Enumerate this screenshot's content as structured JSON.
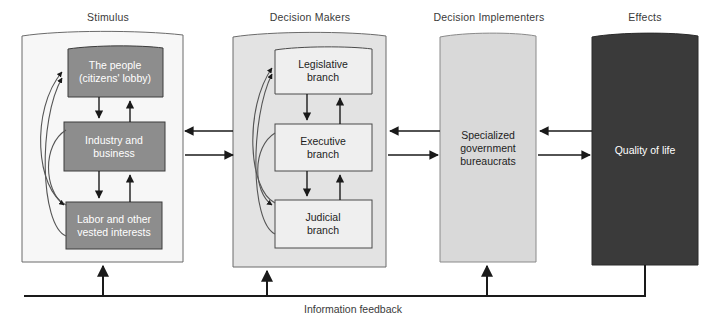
{
  "diagram": {
    "title_visible": false,
    "columns": [
      {
        "key": "stimulus",
        "label": "Stimulus",
        "label_x": 108,
        "label_y": 11
      },
      {
        "key": "decision_makers",
        "label": "Decision Makers",
        "label_x": 310,
        "label_y": 11
      },
      {
        "key": "decision_implementers",
        "label": "Decision Implementers",
        "label_x": 489,
        "label_y": 11
      },
      {
        "key": "effects",
        "label": "Effects",
        "label_x": 645,
        "label_y": 11
      }
    ],
    "panels": [
      {
        "key": "stimulus-panel",
        "x": 22,
        "y": 32,
        "w": 161,
        "h": 230,
        "fill": "#f7f7f7",
        "stroke": "#6b6b6b"
      },
      {
        "key": "decision-makers-panel",
        "x": 233,
        "y": 33,
        "w": 153,
        "h": 234,
        "fill": "#e3e3e3",
        "stroke": "#6b6b6b"
      }
    ],
    "boxes": [
      {
        "key": "the-people",
        "label": "The people\n(citizens' lobby)",
        "x": 68,
        "y": 46,
        "w": 95,
        "h": 51,
        "fill": "#8d8d8d",
        "stroke": "#3d3d3d",
        "text": "light"
      },
      {
        "key": "industry-and-business",
        "label": "Industry and\nbusiness",
        "x": 64,
        "y": 122,
        "w": 101,
        "h": 49,
        "fill": "#8d8d8d",
        "stroke": "#3d3d3d",
        "text": "light"
      },
      {
        "key": "labor-and-other-vested-interests",
        "label": "Labor and other\nvested interests",
        "x": 66,
        "y": 202,
        "w": 96,
        "h": 47,
        "fill": "#8d8d8d",
        "stroke": "#3d3d3d",
        "text": "light"
      },
      {
        "key": "legislative-branch",
        "label": "Legislative\nbranch",
        "x": 275,
        "y": 47,
        "w": 97,
        "h": 47,
        "fill": "#efefef",
        "stroke": "#4a4a4a",
        "text": "dark"
      },
      {
        "key": "executive-branch",
        "label": "Executive\nbranch",
        "x": 275,
        "y": 124,
        "w": 97,
        "h": 47,
        "fill": "#efefef",
        "stroke": "#4a4a4a",
        "text": "dark"
      },
      {
        "key": "judicial-branch",
        "label": "Judicial\nbranch",
        "x": 275,
        "y": 200,
        "w": 97,
        "h": 48,
        "fill": "#efefef",
        "stroke": "#4a4a4a",
        "text": "dark"
      },
      {
        "key": "specialized-government-bureaucrats",
        "label": "Specialized\ngovernment\nbureaucrats",
        "x": 440,
        "y": 33,
        "w": 96,
        "h": 229,
        "fill": "#d9d9d9",
        "stroke": "#8a8a8a",
        "text": "dark"
      },
      {
        "key": "quality-of-life",
        "label": "Quality of life",
        "x": 592,
        "y": 33,
        "w": 106,
        "h": 232,
        "fill": "#3a3a3a",
        "stroke": "#2a2a2a",
        "text": "light"
      }
    ],
    "feedback": {
      "label": "Information feedback",
      "label_x": 353,
      "label_y": 303,
      "line_y": 296
    },
    "colors": {
      "page_background": "#ffffff",
      "stimulus_panel_fill": "#f7f7f7",
      "decision_makers_panel_fill": "#e3e3e3",
      "stimulus_box_fill": "#8d8d8d",
      "branch_box_fill": "#efefef",
      "implementer_fill": "#d9d9d9",
      "effects_fill": "#3a3a3a",
      "line_color": "#1a1a1a",
      "label_color": "#3a3a3a"
    }
  }
}
